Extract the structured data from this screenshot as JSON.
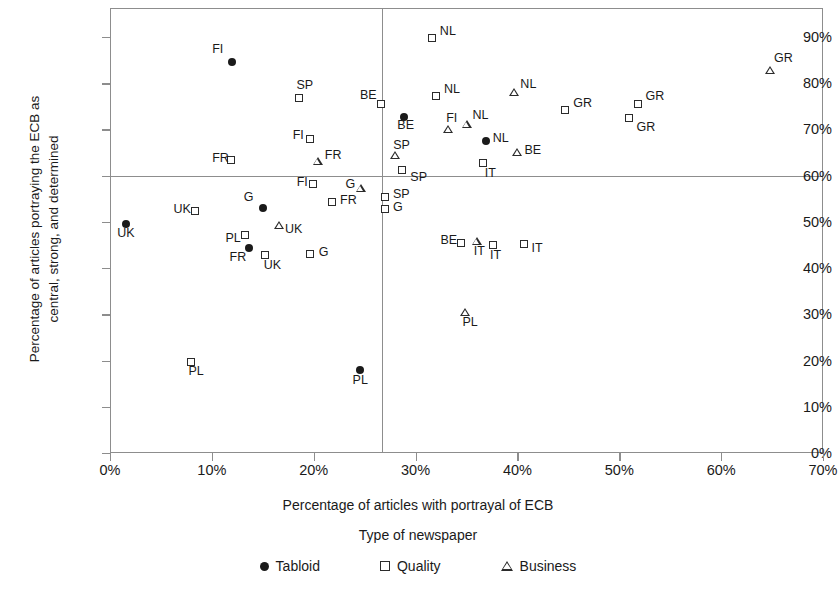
{
  "chart_data": {
    "type": "scatter",
    "title": "",
    "xlabel": "Percentage of articles with portrayal of ECB",
    "ylabel_line1": "Percentage of articles portraying the ECB as",
    "ylabel_line2": "central, strong, and determined",
    "xlim": [
      0,
      70
    ],
    "ylim": [
      0,
      95
    ],
    "xticks": [
      "0%",
      "10%",
      "20%",
      "30%",
      "40%",
      "50%",
      "60%",
      "70%"
    ],
    "xtick_values": [
      0,
      10,
      20,
      30,
      40,
      50,
      60,
      70
    ],
    "yticks": [
      "0%",
      "10%",
      "20%",
      "30%",
      "40%",
      "50%",
      "60%",
      "70%",
      "80%",
      "90%"
    ],
    "ytick_values": [
      0,
      10,
      20,
      30,
      40,
      50,
      60,
      70,
      80,
      90
    ],
    "grid": false,
    "reference_lines": {
      "vertical_x": 26.7,
      "horizontal_y": 60
    },
    "legend_title": "Type of newspaper",
    "legend_position": "bottom",
    "series": [
      {
        "name": "Tabloid",
        "marker": "filled-circle",
        "color": "#1a1a1a",
        "points": [
          {
            "label": "FI",
            "x": 12.0,
            "y": 84.5,
            "lx": -20,
            "ly": -13
          },
          {
            "label": "BE",
            "x": 28.9,
            "y": 72.6,
            "lx": -7,
            "ly": 8
          },
          {
            "label": "NL",
            "x": 36.9,
            "y": 67.5,
            "lx": 7,
            "ly": -3
          },
          {
            "label": "G",
            "x": 15.0,
            "y": 53.0,
            "lx": -19,
            "ly": -11
          },
          {
            "label": "UK",
            "x": 1.6,
            "y": 49.6,
            "lx": -9,
            "ly": 9
          },
          {
            "label": "FR",
            "x": 13.6,
            "y": 44.3,
            "lx": -19,
            "ly": 9
          },
          {
            "label": "PL",
            "x": 24.5,
            "y": 18.0,
            "lx": -7,
            "ly": 10
          }
        ]
      },
      {
        "name": "Quality",
        "marker": "open-square",
        "color": "#2b2b2b",
        "points": [
          {
            "label": "NL",
            "x": 31.6,
            "y": 89.7,
            "lx": 8,
            "ly": -7
          },
          {
            "label": "SP",
            "x": 18.6,
            "y": 76.8,
            "lx": -3,
            "ly": -13
          },
          {
            "label": "BE",
            "x": 26.6,
            "y": 75.5,
            "lx": -21,
            "ly": -9
          },
          {
            "label": "NL",
            "x": 32.0,
            "y": 77.3,
            "lx": 8,
            "ly": -7
          },
          {
            "label": "GR",
            "x": 44.7,
            "y": 74.2,
            "lx": 8,
            "ly": -7
          },
          {
            "label": "GR",
            "x": 51.8,
            "y": 75.5,
            "lx": 8,
            "ly": -8
          },
          {
            "label": "GR",
            "x": 51.0,
            "y": 72.5,
            "lx": 7,
            "ly": 9
          },
          {
            "label": "FI",
            "x": 19.6,
            "y": 68.0,
            "lx": -17,
            "ly": -4
          },
          {
            "label": "FR",
            "x": 11.9,
            "y": 63.3,
            "lx": -19,
            "ly": -2
          },
          {
            "label": "IT",
            "x": 36.6,
            "y": 62.8,
            "lx": 2,
            "ly": 10
          },
          {
            "label": "SP",
            "x": 28.7,
            "y": 61.2,
            "lx": 8,
            "ly": 7
          },
          {
            "label": "FI",
            "x": 19.9,
            "y": 58.2,
            "lx": -16,
            "ly": -2
          },
          {
            "label": "SP",
            "x": 27.0,
            "y": 55.4,
            "lx": 8,
            "ly": -3
          },
          {
            "label": "G",
            "x": 27.0,
            "y": 52.7,
            "lx": 8,
            "ly": -2
          },
          {
            "label": "FR",
            "x": 21.8,
            "y": 54.2,
            "lx": 8,
            "ly": -2
          },
          {
            "label": "UK",
            "x": 8.3,
            "y": 52.4,
            "lx": -21,
            "ly": -2
          },
          {
            "label": "PL",
            "x": 13.3,
            "y": 47.2,
            "lx": -20,
            "ly": 3
          },
          {
            "label": "BE",
            "x": 34.5,
            "y": 45.4,
            "lx": -21,
            "ly": -3
          },
          {
            "label": "IT",
            "x": 37.6,
            "y": 45.1,
            "lx": -3,
            "ly": 10
          },
          {
            "label": "IT",
            "x": 40.6,
            "y": 45.2,
            "lx": 8,
            "ly": 4
          },
          {
            "label": "UK",
            "x": 15.2,
            "y": 42.9,
            "lx": -1,
            "ly": 10
          },
          {
            "label": "G",
            "x": 19.6,
            "y": 43.1,
            "lx": 9,
            "ly": -2
          },
          {
            "label": "PL",
            "x": 8.0,
            "y": 19.7,
            "lx": -3,
            "ly": 9
          }
        ]
      },
      {
        "name": "Business",
        "marker": "open-triangle",
        "color": "#2b2b2b",
        "points": [
          {
            "label": "GR",
            "x": 64.8,
            "y": 82.7,
            "lx": 4,
            "ly": -13
          },
          {
            "label": "NL",
            "x": 39.7,
            "y": 78.0,
            "lx": 6,
            "ly": -8
          },
          {
            "label": "NL",
            "x": 35.0,
            "y": 71.2,
            "lx": 6,
            "ly": -9
          },
          {
            "label": "FI",
            "x": 33.2,
            "y": 70.0,
            "lx": -2,
            "ly": -11
          },
          {
            "label": "BE",
            "x": 40.0,
            "y": 65.0,
            "lx": 7,
            "ly": -3
          },
          {
            "label": "SP",
            "x": 28.0,
            "y": 64.3,
            "lx": -2,
            "ly": -11
          },
          {
            "label": "FR",
            "x": 20.4,
            "y": 63.2,
            "lx": 7,
            "ly": -6
          },
          {
            "label": "G",
            "x": 24.6,
            "y": 57.2,
            "lx": -15,
            "ly": -5
          },
          {
            "label": "UK",
            "x": 16.6,
            "y": 49.3,
            "lx": 6,
            "ly": 4
          },
          {
            "label": "IT",
            "x": 36.0,
            "y": 45.9,
            "lx": -3,
            "ly": 10
          },
          {
            "label": "PL",
            "x": 34.9,
            "y": 30.5,
            "lx": -3,
            "ly": 10
          }
        ]
      }
    ]
  },
  "legend": {
    "title": "Type of newspaper",
    "items": [
      {
        "label": "Tabloid",
        "marker": "filled-circle"
      },
      {
        "label": "Quality",
        "marker": "open-square"
      },
      {
        "label": "Business",
        "marker": "open-triangle"
      }
    ]
  }
}
